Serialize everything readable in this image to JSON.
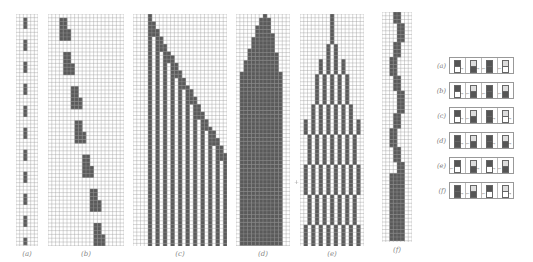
{
  "figure": {
    "panels": [
      {
        "id": "a",
        "label": "(a)",
        "x": 16,
        "y": 14,
        "w": 22,
        "h": 232,
        "cols": 6,
        "pattern": "repeat-blocks"
      },
      {
        "id": "b",
        "label": "(b)",
        "x": 48,
        "y": 14,
        "w": 76,
        "h": 232,
        "cols": 20,
        "pattern": "diagonal-blocks"
      },
      {
        "id": "c",
        "label": "(c)",
        "x": 133,
        "y": 14,
        "w": 94,
        "h": 232,
        "cols": 25,
        "pattern": "stripes-diagonal"
      },
      {
        "id": "d",
        "label": "(d)",
        "x": 236,
        "y": 14,
        "w": 54,
        "h": 232,
        "cols": 14,
        "pattern": "triangle-fill"
      },
      {
        "id": "e",
        "label": "(e)",
        "x": 300,
        "y": 14,
        "w": 64,
        "h": 232,
        "cols": 17,
        "pattern": "branching"
      },
      {
        "id": "f",
        "label": "(f)",
        "x": 382,
        "y": 12,
        "w": 30,
        "h": 230,
        "cols": 8,
        "pattern": "wobble"
      }
    ],
    "plus_mark": "+",
    "colors": {
      "grid": "#9a9a9a",
      "fill": "#5a5a5a",
      "background": "#ffffff"
    }
  },
  "legend": {
    "rows": [
      {
        "label": "(a)",
        "cells": [
          {
            "top": "dark",
            "bot": "white",
            "arrow": "→"
          },
          {
            "top": "light",
            "bot": "dark",
            "arrow": "→"
          },
          {
            "top": "dark",
            "bot": "dark",
            "arrow": "←"
          },
          {
            "top": "light",
            "bot": "white",
            "arrow": "←"
          }
        ]
      },
      {
        "label": "(b)",
        "cells": [
          {
            "top": "dark",
            "bot": "white",
            "arrow": "→"
          },
          {
            "top": "light",
            "bot": "dark",
            "arrow": "←"
          },
          {
            "top": "dark",
            "bot": "dark",
            "arrow": "←"
          },
          {
            "top": "light",
            "bot": "dark",
            "arrow": "←"
          }
        ]
      },
      {
        "label": "(c)",
        "cells": [
          {
            "top": "dark",
            "bot": "white",
            "arrow": "→"
          },
          {
            "top": "light",
            "bot": "dark",
            "arrow": "←"
          },
          {
            "top": "dark",
            "bot": "dark",
            "arrow": "→"
          },
          {
            "top": "light",
            "bot": "white",
            "arrow": "→"
          }
        ]
      },
      {
        "label": "(d)",
        "cells": [
          {
            "top": "dark",
            "bot": "dark",
            "arrow": "→"
          },
          {
            "top": "light",
            "bot": "dark",
            "arrow": "←"
          },
          {
            "top": "dark",
            "bot": "dark",
            "arrow": "→"
          },
          {
            "top": "light",
            "bot": "dark",
            "arrow": "→"
          }
        ]
      },
      {
        "label": "(e)",
        "cells": [
          {
            "top": "dark",
            "bot": "white",
            "arrow": "←"
          },
          {
            "top": "light",
            "bot": "dark",
            "arrow": "→"
          },
          {
            "top": "dark",
            "bot": "white",
            "arrow": "→"
          },
          {
            "top": "light",
            "bot": "dark",
            "arrow": "←"
          }
        ]
      },
      {
        "label": "(f)",
        "cells": [
          {
            "top": "dark",
            "bot": "dark",
            "arrow": "→"
          },
          {
            "top": "light",
            "bot": "dark",
            "arrow": "←"
          },
          {
            "top": "dark",
            "bot": "white",
            "arrow": "←"
          },
          {
            "top": "light",
            "bot": "white",
            "arrow": "→"
          }
        ]
      }
    ],
    "row_y": [
      57,
      82,
      107,
      132,
      157,
      182
    ]
  }
}
